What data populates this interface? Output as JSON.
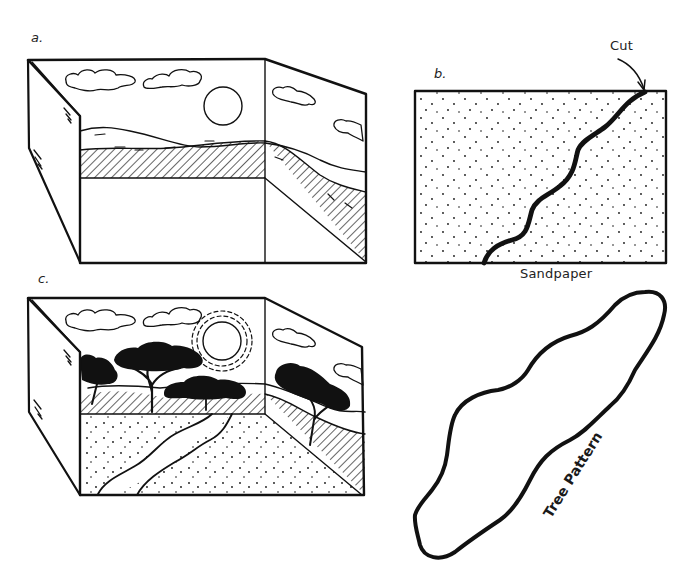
{
  "figure": {
    "type": "instructional line drawing",
    "ink_color": "#111111",
    "background": "#ffffff"
  },
  "panels": {
    "a": {
      "label": "a.",
      "label_pos": [
        31,
        36
      ],
      "description": "Open box with painted backdrop: clouds, sun, rolling hills, hatched ground band",
      "box": {
        "back_left_top": [
          80,
          60
        ],
        "back_right_top": [
          265,
          60
        ],
        "back_right_bottom": [
          265,
          262
        ],
        "back_left_bottom": [
          80,
          262
        ],
        "front_left_top": [
          32,
          60
        ],
        "side_right_top": [
          366,
          94
        ],
        "side_right_bottom": [
          366,
          262
        ]
      },
      "sun": {
        "cx": 223,
        "cy": 106,
        "r": 19
      }
    },
    "b": {
      "label": "b.",
      "label_pos": [
        434,
        73
      ],
      "caption": "Sandpaper",
      "caption_pos": [
        520,
        268
      ],
      "callout": "Cut",
      "callout_pos": [
        610,
        42
      ],
      "rect": {
        "x": 415,
        "y": 91,
        "w": 251,
        "h": 172
      }
    },
    "c": {
      "label": "c.",
      "label_pos": [
        38,
        275
      ],
      "description": "Finished diorama: trees, sun with dashed rays, river across sandpaper ground"
    },
    "tree_pattern": {
      "label": "Tree Pattern",
      "label_pos": [
        553,
        505
      ],
      "label_rotation_deg": -58
    }
  }
}
